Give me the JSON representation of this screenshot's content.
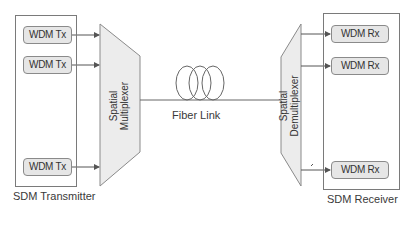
{
  "transmitter": {
    "label": "SDM Transmitter",
    "channels": [
      {
        "label": "WDM Tx"
      },
      {
        "label": "WDM Tx"
      },
      {
        "label": "WDM Tx"
      }
    ]
  },
  "multiplexer": {
    "line1": "Spatial",
    "line2": "Multiplexer"
  },
  "fiber": {
    "label": "Fiber Link"
  },
  "demultiplexer": {
    "line1": "Spatial",
    "line2": "Demultiplexer"
  },
  "receiver": {
    "label": "SDM Receiver",
    "channels": [
      {
        "label": "WDM Rx"
      },
      {
        "label": "WDM Rx"
      },
      {
        "label": "WDM Rx"
      }
    ]
  },
  "colors": {
    "stroke": "#6e6e6e",
    "box_fill": "#e6e6e6",
    "mux_fill": "#ececec",
    "text": "#3a3a3a"
  }
}
